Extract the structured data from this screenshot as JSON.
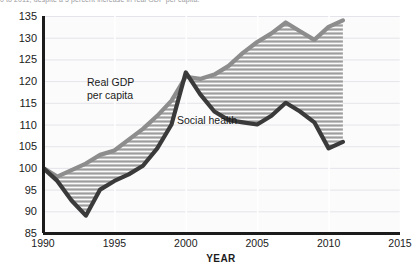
{
  "caption": {
    "text": "0 to 2011, despite a 5 percent increase in real GDP per capita."
  },
  "chart_data": {
    "type": "line",
    "title": "",
    "xlabel": "YEAR",
    "ylabel": "",
    "xlim": [
      1990,
      2015
    ],
    "ylim": [
      85,
      135
    ],
    "xticks": [
      1990,
      1995,
      2000,
      2005,
      2010,
      2015
    ],
    "yticks": [
      85,
      90,
      95,
      100,
      105,
      110,
      115,
      120,
      125,
      130,
      135
    ],
    "grid": true,
    "legend": "inline-annotations",
    "fill_between": true,
    "fill_style": "horizontal-hatch",
    "colors": {
      "gdp_line": "#8d8d8d",
      "social_line": "#3a3a3a",
      "hatch": "#9a9a9a",
      "plot_bg": "#fbfbfb",
      "axis": "#1b1b1b",
      "gridline": "#e4e4ea"
    },
    "annotations": [
      {
        "label": "Real GDP per capita",
        "x": 1993.8,
        "y": 117.5
      },
      {
        "label": "Social health",
        "x": 2000.6,
        "y": 110.0
      }
    ],
    "x": [
      1990,
      1991,
      1992,
      1993,
      1994,
      1995,
      1996,
      1997,
      1998,
      1999,
      2000,
      2001,
      2002,
      2003,
      2004,
      2005,
      2006,
      2007,
      2008,
      2009,
      2010,
      2011
    ],
    "series": [
      {
        "name": "Real GDP per capita",
        "values": [
          100.0,
          98.0,
          99.5,
          101.0,
          103.0,
          104.0,
          106.5,
          109.0,
          112.0,
          115.5,
          121.0,
          120.5,
          121.5,
          123.5,
          126.5,
          129.0,
          131.0,
          133.5,
          131.5,
          129.5,
          132.5,
          134.0
        ]
      },
      {
        "name": "Social health",
        "values": [
          100.0,
          97.0,
          92.5,
          89.0,
          95.0,
          97.0,
          98.5,
          100.5,
          104.5,
          110.0,
          122.0,
          117.0,
          113.0,
          111.0,
          110.5,
          110.0,
          112.0,
          115.0,
          113.0,
          110.5,
          104.5,
          106.0
        ]
      }
    ]
  },
  "axis_labels": {
    "y": [
      "135",
      "130",
      "125",
      "120",
      "115",
      "110",
      "105",
      "100",
      "95",
      "90",
      "85"
    ],
    "x": [
      "1990",
      "1995",
      "2000",
      "2005",
      "2010",
      "2015"
    ],
    "x_title": "YEAR"
  }
}
